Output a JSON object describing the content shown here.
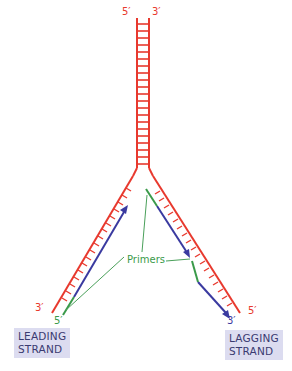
{
  "diagram": {
    "colors": {
      "parent_strand": "#e8392e",
      "new_strand": "#3a3aa0",
      "primer": "#3a9a4a",
      "label_box": "#dcdcf0"
    },
    "labels": {
      "top_left": "5′",
      "top_right": "3′",
      "leading_end_red": "3′",
      "leading_end_green": "5′",
      "lagging_end_red": "5′",
      "lagging_end_blue": "3′",
      "primers": "Primers"
    },
    "boxes": {
      "leading": [
        "LEADING",
        "STRAND"
      ],
      "lagging": [
        "LAGGING",
        "STRAND"
      ]
    }
  }
}
